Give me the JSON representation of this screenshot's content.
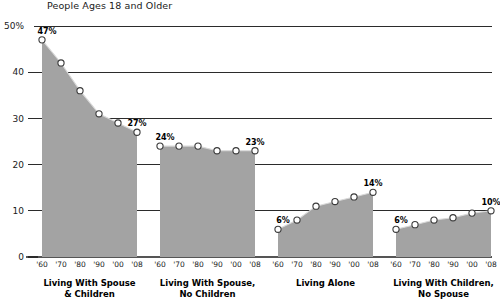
{
  "chart_data": {
    "type": "area",
    "title": "People Ages 18 and Older",
    "xlabel": "",
    "ylabel": "",
    "ylim": [
      0,
      50
    ],
    "grid": true,
    "legend_position": "none",
    "y_ticks": [
      {
        "value": 50,
        "label": "50%"
      },
      {
        "value": 40,
        "label": "40"
      },
      {
        "value": 30,
        "label": "30"
      },
      {
        "value": 20,
        "label": "20"
      },
      {
        "value": 10,
        "label": "10"
      },
      {
        "value": 0,
        "label": "0"
      }
    ],
    "x": [
      "'60",
      "'70",
      "'80",
      "'90",
      "'00",
      "'08"
    ],
    "panels": [
      {
        "category": "Living With Spouse & Children",
        "category_line1": "Living With Spouse",
        "category_line2": "& Children",
        "values": [
          47,
          42,
          36,
          31,
          29,
          27
        ],
        "annotations": [
          {
            "index": 0,
            "label": "47%"
          },
          {
            "index": 5,
            "label": "27%"
          }
        ]
      },
      {
        "category": "Living With Spouse, No Children",
        "category_line1": "Living With Spouse,",
        "category_line2": "No Children",
        "values": [
          24,
          24,
          24,
          23,
          23,
          23
        ],
        "annotations": [
          {
            "index": 0,
            "label": "24%"
          },
          {
            "index": 5,
            "label": "23%"
          }
        ]
      },
      {
        "category": "Living Alone",
        "category_line1": "Living Alone",
        "category_line2": "",
        "values": [
          6,
          8,
          11,
          12,
          13,
          14
        ],
        "annotations": [
          {
            "index": 0,
            "label": "6%"
          },
          {
            "index": 5,
            "label": "14%"
          }
        ]
      },
      {
        "category": "Living With Children, No Spouse",
        "category_line1": "Living With Children,",
        "category_line2": "No Spouse",
        "values": [
          6,
          7,
          8,
          8.5,
          9.5,
          10
        ],
        "annotations": [
          {
            "index": 0,
            "label": "6%"
          },
          {
            "index": 5,
            "label": "10%"
          }
        ]
      }
    ],
    "colors": {
      "area_fill": "#a3a3a3",
      "marker_fill": "#ffffff",
      "marker_stroke": "#3a3a3a",
      "grid": "#2b2b2b",
      "text": "#1a1a1a",
      "background": "#ffffff"
    }
  }
}
